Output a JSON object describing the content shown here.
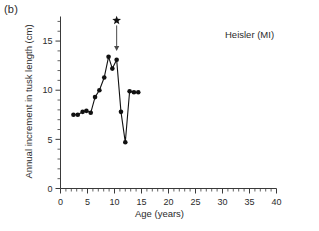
{
  "panel": {
    "label": "(b)"
  },
  "chart_data": {
    "type": "line",
    "title": "Heisler (MI)",
    "xlabel": "Age (years)",
    "ylabel": "Annual increment in tusk length (cm)",
    "xlim": [
      0,
      40
    ],
    "ylim": [
      0,
      17.5
    ],
    "xticks": [
      0,
      5,
      10,
      15,
      20,
      25,
      30,
      35,
      40
    ],
    "xticklabels": [
      "0",
      "5",
      "10",
      "15",
      "20",
      "25",
      "30",
      "35",
      "40"
    ],
    "xminor_step": 1,
    "yticks": [
      0,
      5,
      10,
      15
    ],
    "yticklabels": [
      "0",
      "5",
      "10",
      "15"
    ],
    "yminor_step": 1,
    "grid": false,
    "legend": "none",
    "marker": "filled-circle",
    "x": [
      2.4,
      3.2,
      4.1,
      4.8,
      5.6,
      6.4,
      7.2,
      8.1,
      8.9,
      9.6,
      10.4,
      11.2,
      12.0,
      12.8,
      13.6,
      14.4
    ],
    "y": [
      7.5,
      7.5,
      7.8,
      7.9,
      7.7,
      9.3,
      10.0,
      11.3,
      13.4,
      12.2,
      13.1,
      7.8,
      4.7,
      9.9,
      9.8,
      9.8
    ],
    "annotations": [
      {
        "name": "star-marker",
        "symbol": "star",
        "x": 10.4,
        "y": 17.1,
        "arrow_to_x": 10.4,
        "arrow_to_y": 14.0
      }
    ]
  }
}
